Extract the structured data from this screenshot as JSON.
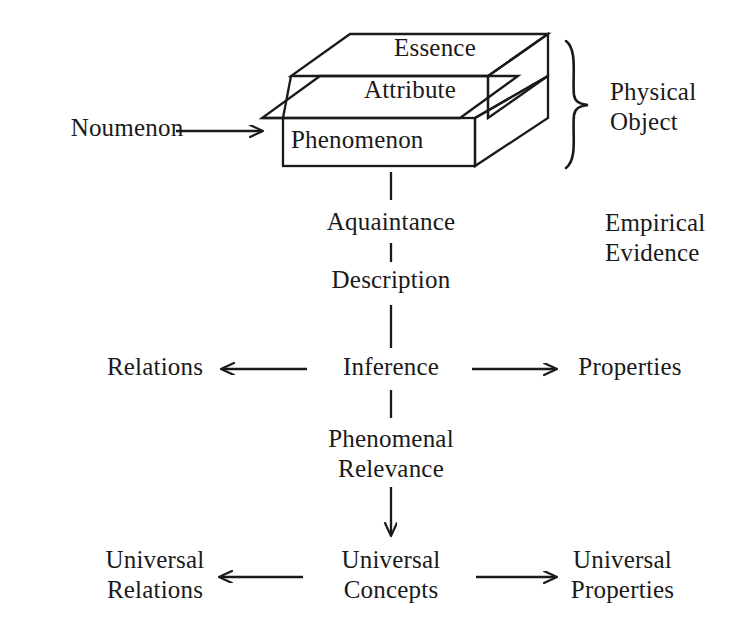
{
  "diagram": {
    "background_color": "#ffffff",
    "stroke_color": "#1a1a1a"
  },
  "object_block": {
    "layers": [
      {
        "name": "essence-layer",
        "label": "Essence"
      },
      {
        "name": "attribute-layer",
        "label": "Attribute"
      },
      {
        "name": "phenomenon-layer",
        "label": "Phenomenon"
      }
    ],
    "brace_label": "Physical Object"
  },
  "labels": {
    "noumenon": "Noumenon",
    "physical_object": "Physical\nObject",
    "empirical_evidence": "Empirical\nEvidence",
    "essence": "Essence",
    "attribute": "Attribute",
    "phenomenon": "Phenomenon",
    "aquaintance": "Aquaintance",
    "description": "Description",
    "inference": "Inference",
    "relations": "Relations",
    "properties": "Properties",
    "phenomenal_relevance": "Phenomenal\nRelevance",
    "universal_relations": "Universal\nRelations",
    "universal_concepts": "Universal\nConcepts",
    "universal_properties": "Universal\nProperties"
  },
  "connectors": [
    {
      "name": "noumenon-to-phenomenon-arrow",
      "kind": "arrow",
      "direction": "right",
      "from": "Noumenon",
      "to": "Phenomenon"
    },
    {
      "name": "phenomenon-to-aquaintance-link",
      "kind": "line",
      "direction": "vertical",
      "from": "Phenomenon",
      "to": "Aquaintance"
    },
    {
      "name": "aquaintance-to-description-link",
      "kind": "line",
      "direction": "vertical",
      "from": "Aquaintance",
      "to": "Description"
    },
    {
      "name": "description-to-inference-link",
      "kind": "line",
      "direction": "vertical",
      "from": "Description",
      "to": "Inference"
    },
    {
      "name": "inference-to-relations-arrow",
      "kind": "arrow",
      "direction": "left",
      "from": "Inference",
      "to": "Relations"
    },
    {
      "name": "inference-to-properties-arrow",
      "kind": "arrow",
      "direction": "right",
      "from": "Inference",
      "to": "Properties"
    },
    {
      "name": "inference-to-phenomenal-relevance-link",
      "kind": "line",
      "direction": "vertical",
      "from": "Inference",
      "to": "Phenomenal Relevance"
    },
    {
      "name": "phenomenal-relevance-to-universal-concepts-arrow",
      "kind": "arrow",
      "direction": "down",
      "from": "Phenomenal Relevance",
      "to": "Universal Concepts"
    },
    {
      "name": "universal-concepts-to-universal-relations-arrow",
      "kind": "arrow",
      "direction": "left",
      "from": "Universal Concepts",
      "to": "Universal Relations"
    },
    {
      "name": "universal-concepts-to-universal-properties-arrow",
      "kind": "arrow",
      "direction": "right",
      "from": "Universal Concepts",
      "to": "Universal Properties"
    }
  ]
}
